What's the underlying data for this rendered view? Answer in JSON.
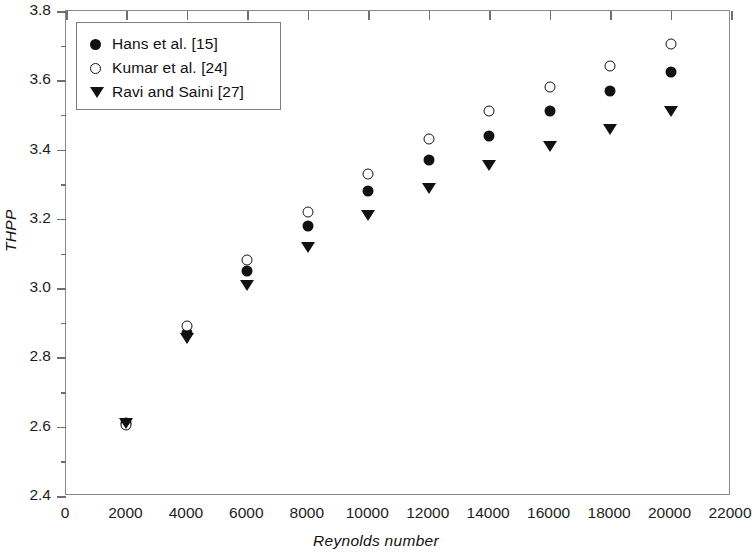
{
  "chart_data": {
    "type": "scatter",
    "title": "",
    "xlabel": "Reynolds number",
    "ylabel": "THPP",
    "xlim": [
      0,
      22000
    ],
    "ylim": [
      2.4,
      3.8
    ],
    "xticks": [
      "0",
      "2000",
      "4000",
      "6000",
      "8000",
      "10000",
      "12000",
      "14000",
      "16000",
      "18000",
      "20000",
      "22000"
    ],
    "xtick_values": [
      0,
      2000,
      4000,
      6000,
      8000,
      10000,
      12000,
      14000,
      16000,
      18000,
      20000,
      22000
    ],
    "yticks": [
      "2.4",
      "2.6",
      "2.8",
      "3.0",
      "3.2",
      "3.4",
      "3.6",
      "3.8"
    ],
    "ytick_values": [
      2.4,
      2.6,
      2.8,
      3.0,
      3.2,
      3.4,
      3.6,
      3.8
    ],
    "grid": false,
    "legend_position": "top-left",
    "x": [
      2000,
      4000,
      6000,
      8000,
      10000,
      12000,
      14000,
      16000,
      18000,
      20000
    ],
    "series": [
      {
        "name": "Hans et al. [15]",
        "marker": "filled-circle",
        "color": "#111111",
        "values": [
          2.61,
          2.87,
          3.05,
          3.18,
          3.28,
          3.37,
          3.44,
          3.51,
          3.57,
          3.625
        ]
      },
      {
        "name": "Kumar et al. [24]",
        "marker": "open-circle",
        "color": "#141414",
        "values": [
          2.605,
          2.89,
          3.08,
          3.22,
          3.33,
          3.43,
          3.51,
          3.58,
          3.64,
          3.705
        ]
      },
      {
        "name": "Ravi and Saini [27]",
        "marker": "down-triangle",
        "color": "#111111",
        "values": [
          2.61,
          2.855,
          3.01,
          3.12,
          3.21,
          3.29,
          3.355,
          3.41,
          3.46,
          3.51
        ]
      }
    ]
  },
  "legend": {
    "entries": [
      {
        "label": "Hans et al. [15]",
        "marker": "filled-circle"
      },
      {
        "label": "Kumar et al. [24]",
        "marker": "open-circle"
      },
      {
        "label": "Ravi and Saini [27]",
        "marker": "down-triangle"
      }
    ]
  },
  "axes": {
    "x_title": "Reynolds number",
    "y_title": "THPP"
  }
}
